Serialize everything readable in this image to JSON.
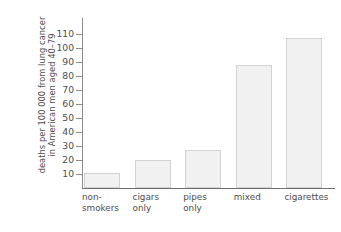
{
  "chart_data": {
    "type": "bar",
    "title": "",
    "xlabel": "",
    "ylabel": "deaths per 100 000 from lung cancer in American men aged 40–79",
    "ylabel_lines": [
      "deaths per 100 000 from lung cancer",
      "in American men aged 40–79"
    ],
    "categories": [
      "non-smokers",
      "cigars only",
      "pipes only",
      "mixed",
      "cigarettes"
    ],
    "category_labels": [
      "non-\nsmokers",
      "cigars\nonly",
      "pipes\nonly",
      "mixed",
      "cigarettes"
    ],
    "values": [
      11,
      20,
      27,
      88,
      107
    ],
    "ylim": [
      0,
      114
    ],
    "yticks": [
      10,
      20,
      30,
      40,
      50,
      60,
      70,
      80,
      90,
      100,
      110
    ],
    "ytick_labels": [
      "10",
      "20",
      "30",
      "40",
      "50",
      "60",
      "70",
      "80",
      "90",
      "100",
      "110"
    ],
    "grid": false,
    "legend": false,
    "bar_fill_color": "#f1f1f1",
    "bar_border_color": "#d2d2d2",
    "axis_color": "#6f6f6f",
    "text_color": "#4d4d4d",
    "background_color": "#ffffff"
  }
}
